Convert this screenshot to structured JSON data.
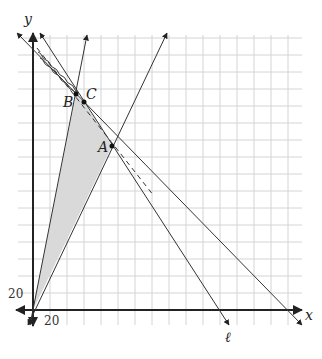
{
  "diagram": {
    "type": "coordinate-plane-linear-programming",
    "axes": {
      "x_label": "x",
      "y_label": "y",
      "x_tick_label": "20",
      "y_tick_label": "20",
      "grid_step": 20
    },
    "points": [
      {
        "name": "A",
        "label": "A"
      },
      {
        "name": "B",
        "label": "B"
      },
      {
        "name": "C",
        "label": "C"
      }
    ],
    "line_label": "ℓ",
    "shaded_region": "triangle O-B-A (feasible region)",
    "colors": {
      "grid": "#d4d4d4",
      "axis": "#222222",
      "line": "#333333",
      "shade": "#d9d9d9"
    }
  }
}
